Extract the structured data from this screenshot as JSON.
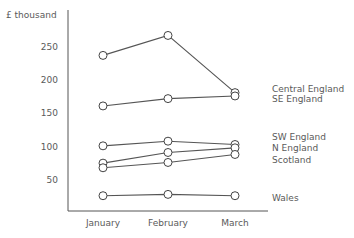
{
  "chart_data": {
    "type": "line",
    "title": "",
    "ylabel": "£ thousand",
    "xlabel": "",
    "categories": [
      "January",
      "February",
      "March"
    ],
    "yticks": [
      50,
      100,
      150,
      200,
      250
    ],
    "ylim": [
      0,
      300
    ],
    "grid": false,
    "legend_position": "right (direct labels)",
    "series": [
      {
        "name": "Central England",
        "values": [
          237,
          267,
          181
        ]
      },
      {
        "name": "SE England",
        "values": [
          161,
          172,
          176
        ]
      },
      {
        "name": "SW England",
        "values": [
          101,
          108,
          103
        ]
      },
      {
        "name": "N England",
        "values": [
          75,
          91,
          98
        ]
      },
      {
        "name": "Scotland",
        "values": [
          68,
          76,
          88
        ]
      },
      {
        "name": "Wales",
        "values": [
          26,
          28,
          26
        ]
      }
    ],
    "label_y": [
      89,
      99,
      137,
      148,
      160,
      198
    ]
  },
  "colors": {
    "line": "#555555",
    "text": "#5a5a5a"
  }
}
